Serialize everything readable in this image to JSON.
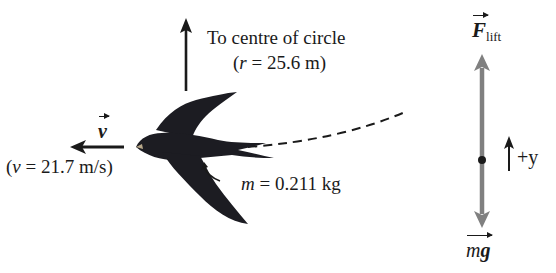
{
  "diagram": {
    "centre_arrow": {
      "label_line1": "To centre of circle",
      "label_line2_prefix": "(",
      "label_line2_var": "r",
      "label_line2_rest": " = 25.6 m)"
    },
    "velocity": {
      "symbol": "v",
      "value_prefix": "(",
      "value_var": "v",
      "value_rest": " = 21.7 m/s)"
    },
    "mass": {
      "var": "m",
      "rest": " = 0.211 kg"
    },
    "free_body": {
      "lift_symbol": "F",
      "lift_subscript": "lift",
      "weight_symbol_m": "m",
      "weight_symbol_g": "g",
      "axis_label": "+y"
    },
    "colors": {
      "force_arrow": "#808080",
      "ink": "#1a1a1a",
      "bird": "#1c1c22"
    }
  }
}
